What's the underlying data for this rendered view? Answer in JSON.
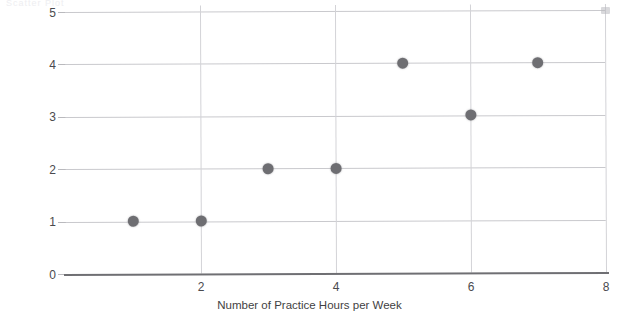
{
  "artifact": {
    "top_clipped_text": "Scatter Plot"
  },
  "chart_data": {
    "type": "scatter",
    "title": "",
    "xlabel": "Number of  Practice Hours per Week",
    "ylabel": "Goals Scored in Game",
    "xlim": [
      0,
      8
    ],
    "ylim": [
      0,
      5
    ],
    "xticks": [
      2,
      4,
      6,
      8
    ],
    "xtick_labels": [
      "2",
      "4",
      "6",
      "8"
    ],
    "yticks": [
      0,
      1,
      2,
      3,
      4,
      5
    ],
    "ytick_labels": [
      "0",
      "1",
      "2",
      "3",
      "4",
      "5"
    ],
    "grid": true,
    "legend": null,
    "marker_color": "#6e6e72",
    "gridline_color": "#c9c9cd",
    "axis_color": "#6f6f73",
    "points": [
      {
        "x": 1,
        "y": 1
      },
      {
        "x": 2,
        "y": 1
      },
      {
        "x": 3,
        "y": 2
      },
      {
        "x": 4,
        "y": 2
      },
      {
        "x": 5,
        "y": 4
      },
      {
        "x": 6,
        "y": 3
      },
      {
        "x": 7,
        "y": 4
      }
    ],
    "stray_marks": [
      {
        "x": 8,
        "y": 5
      }
    ]
  }
}
